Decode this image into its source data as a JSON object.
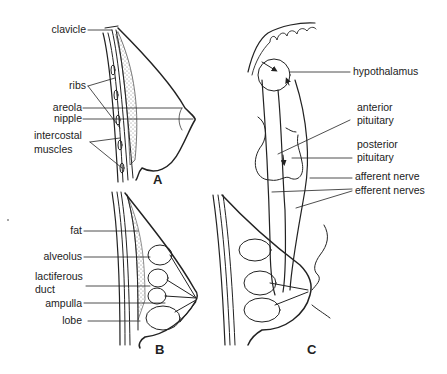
{
  "figure": {
    "panels": [
      {
        "id": "A",
        "label": "A",
        "labels": [
          "clavicle",
          "ribs",
          "areola",
          "nipple",
          "intercostal",
          "muscles"
        ]
      },
      {
        "id": "B",
        "label": "B",
        "labels": [
          "fat",
          "alveolus",
          "lactiferous",
          "duct",
          "ampulla",
          "lobe"
        ]
      },
      {
        "id": "C",
        "label": "C",
        "labels": [
          "hypothalamus",
          "anterior",
          "pituitary",
          "posterior",
          "pituitary",
          "afferent nerve",
          "efferent nerves"
        ]
      }
    ],
    "colors": {
      "line": "#222222",
      "background": "#ffffff"
    }
  },
  "A": {
    "panel": "A",
    "clavicle": "clavicle",
    "ribs": "ribs",
    "areola": "areola",
    "nipple": "nipple",
    "intercostal": "intercostal",
    "muscles": "muscles"
  },
  "B": {
    "panel": "B",
    "fat": "fat",
    "alveolus": "alveolus",
    "lactiferous": "lactiferous",
    "duct": "duct",
    "ampulla": "ampulla",
    "lobe": "lobe"
  },
  "C": {
    "panel": "C",
    "hypothalamus": "hypothalamus",
    "anterior": "anterior",
    "anterior_pit": "pituitary",
    "posterior": "posterior",
    "posterior_pit": "pituitary",
    "afferent": "afferent nerve",
    "efferent": "efferent nerves"
  }
}
